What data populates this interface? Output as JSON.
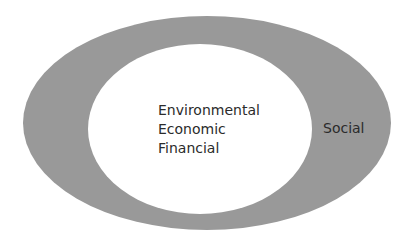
{
  "diagram": {
    "type": "nested-ellipses",
    "colors": {
      "outer_fill": "#999999",
      "inner_fill": "#ffffff",
      "text": "#2b2b2b",
      "background": "#ffffff"
    },
    "outer_ellipse": {
      "label": "Social"
    },
    "inner_ellipse": {
      "labels": [
        "Environmental",
        "Economic",
        "Financial"
      ]
    }
  }
}
